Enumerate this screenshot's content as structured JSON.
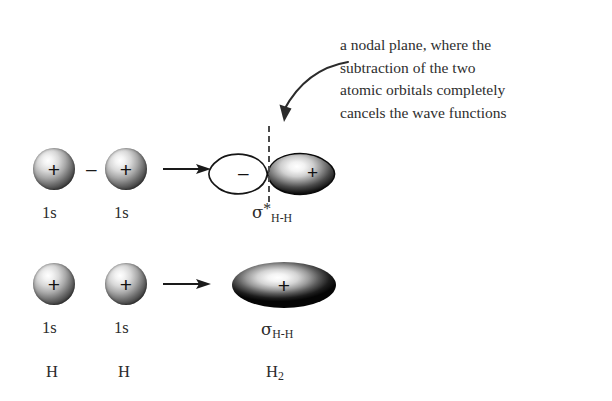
{
  "figure": {
    "background_color": "#ffffff",
    "ink_color": "#2b2b2b"
  },
  "annotation": {
    "name": "nodal-plane-annotation",
    "lines": [
      "a nodal plane, where the",
      "subtraction of the two",
      "atomic orbitals completely",
      "cancels the wave functions"
    ],
    "pointer": "curved-arrow-to-nodal-plane"
  },
  "rows": [
    {
      "name": "antibonding-row",
      "operator": "–",
      "arrow": "→",
      "reactants": [
        {
          "sign": "+",
          "label": "1s"
        },
        {
          "sign": "+",
          "label": "1s"
        }
      ],
      "product": {
        "name": "sigma-star-antibonding-orbital",
        "left_lobe_sign": "–",
        "right_lobe_sign": "+",
        "label_symbol": "σ",
        "label_star": "*",
        "label_subscript": "H-H",
        "nodal_plane": true
      }
    },
    {
      "name": "bonding-row",
      "operator": "",
      "arrow": "→",
      "reactants": [
        {
          "sign": "+",
          "label": "1s"
        },
        {
          "sign": "+",
          "label": "1s"
        }
      ],
      "product": {
        "name": "sigma-bonding-orbital",
        "sign": "+",
        "label_symbol": "σ",
        "label_star": "",
        "label_subscript": "H-H",
        "nodal_plane": false
      }
    }
  ],
  "species_labels": {
    "left_atom": "H",
    "right_atom": "H",
    "molecule_symbol": "H",
    "molecule_subscript": "2"
  }
}
